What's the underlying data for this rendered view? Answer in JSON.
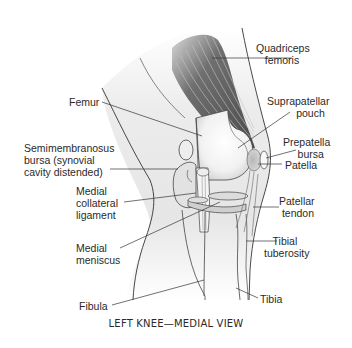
{
  "figure": {
    "caption": "LEFT KNEE—MEDIAL VIEW",
    "labels": {
      "quadriceps": "Quadriceps\n   femoris",
      "femur": "Femur",
      "suprapatellar": "Suprapatellar\n          pouch",
      "prepatella": "Prepatella\n     bursa",
      "patella": "Patella",
      "semimembranosus": "Semimembranosus\nbursa (synovial\ncavity distended)",
      "medial_collateral": "Medial\ncollateral\nligament",
      "patellar_tendon": "Patellar\n tendon",
      "medial_meniscus": "Medial\nmeniscus",
      "tibial_tuberosity": "   Tibial\ntuberosity",
      "fibula": "Fibula",
      "tibia": "Tibia"
    }
  },
  "colors": {
    "line": "#333333",
    "muscle_dark": "#5a5a5a",
    "muscle_light": "#9a9a9a",
    "bone_fill": "#eeeeee",
    "text": "#2a2a2a"
  }
}
